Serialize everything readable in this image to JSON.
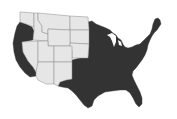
{
  "map": {
    "title": "",
    "region": "Contiguous United States",
    "colors": {
      "highlighted": "#333333",
      "not_highlighted": "#e6e6e6",
      "border": "#8a8a8a",
      "background": "#ffffff"
    },
    "light_states": [
      "WA",
      "ID",
      "MT",
      "WY",
      "ND",
      "SD",
      "NE",
      "NV",
      "UT",
      "CO",
      "AZ",
      "NM"
    ],
    "dark_states": [
      "OR",
      "CA",
      "TX",
      "OK",
      "KS",
      "MN",
      "IA",
      "MO",
      "AR",
      "LA",
      "WI",
      "IL",
      "MI",
      "IN",
      "OH",
      "KY",
      "TN",
      "MS",
      "AL",
      "GA",
      "FL",
      "SC",
      "NC",
      "VA",
      "WV",
      "MD",
      "DE",
      "PA",
      "NJ",
      "NY",
      "CT",
      "RI",
      "MA",
      "VT",
      "NH",
      "ME"
    ]
  }
}
